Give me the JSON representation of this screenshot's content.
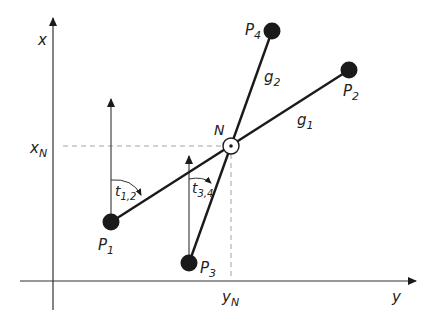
{
  "diagram": {
    "type": "intersection-of-two-lines",
    "axes": {
      "vertical_label": "x",
      "horizontal_label": "y"
    },
    "intersection": {
      "label": "N",
      "x_label_main": "x",
      "x_label_sub": "N",
      "y_label_main": "y",
      "y_label_sub": "N"
    },
    "points": [
      {
        "main": "P",
        "sub": "1"
      },
      {
        "main": "P",
        "sub": "2"
      },
      {
        "main": "P",
        "sub": "3"
      },
      {
        "main": "P",
        "sub": "4"
      }
    ],
    "lines": [
      {
        "main": "g",
        "sub": "1"
      },
      {
        "main": "g",
        "sub": "2"
      }
    ],
    "angles": [
      {
        "main": "t",
        "sub": "1,2"
      },
      {
        "main": "t",
        "sub": "3,4"
      }
    ],
    "colors": {
      "ink": "#1a1a1a",
      "dash": "#999999",
      "background": "#ffffff"
    }
  }
}
